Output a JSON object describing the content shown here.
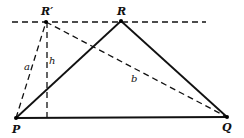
{
  "diagram": {
    "type": "geometry",
    "points": [
      {
        "id": "P",
        "label": "P",
        "x": 16,
        "y": 118,
        "lx": 12,
        "ly": 133
      },
      {
        "id": "Q",
        "label": "Q",
        "x": 227,
        "y": 117,
        "lx": 222,
        "ly": 131
      },
      {
        "id": "R",
        "label": "R",
        "x": 121,
        "y": 21,
        "lx": 117,
        "ly": 15
      },
      {
        "id": "R2",
        "label": "R′",
        "x": 46,
        "y": 22,
        "lx": 42,
        "ly": 15
      }
    ],
    "segment_labels": {
      "a": {
        "text": "a",
        "x": 25,
        "y": 70
      },
      "h": {
        "text": "h",
        "x": 49,
        "y": 64
      },
      "b": {
        "text": "b",
        "x": 132,
        "y": 82
      }
    },
    "colors": {
      "line": "#111111",
      "background": "#ffffff"
    }
  }
}
